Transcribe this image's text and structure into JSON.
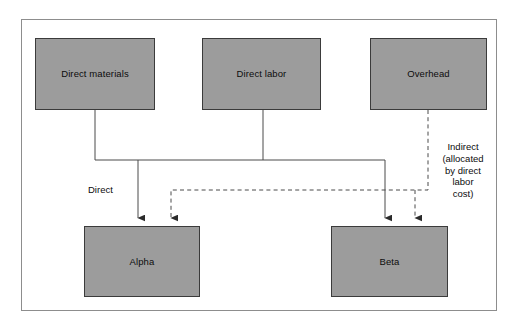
{
  "diagram": {
    "title_visible": false,
    "background": "#ffffff",
    "frame_border_color": "#8d8d8d",
    "node_fill": "#9c9c9c",
    "node_border": "#3b3b3b",
    "line_color": "#4a4a4a",
    "text_color": "#0c0c0c",
    "nodes": [
      {
        "id": "direct-materials",
        "label": "Direct materials",
        "x": 35,
        "y": 38,
        "w": 120,
        "h": 72
      },
      {
        "id": "direct-labor",
        "label": "Direct labor",
        "x": 202,
        "y": 38,
        "w": 119,
        "h": 72
      },
      {
        "id": "overhead",
        "label": "Overhead",
        "x": 370,
        "y": 38,
        "w": 117,
        "h": 72
      },
      {
        "id": "alpha",
        "label": "Alpha",
        "x": 84,
        "y": 226,
        "w": 116,
        "h": 71
      },
      {
        "id": "beta",
        "label": "Beta",
        "x": 331,
        "y": 226,
        "w": 117,
        "h": 71
      }
    ],
    "edge_labels": [
      {
        "id": "direct-label",
        "text": "Direct",
        "x": 88,
        "y": 184
      },
      {
        "id": "indirect-label",
        "text": "Indirect\n(allocated\nby direct\nlabor\ncost)",
        "x": 432,
        "y": 141
      }
    ],
    "edges": [
      {
        "id": "direct-materials-to-bus",
        "style": "solid",
        "from": "direct-materials",
        "to": "cost-bus"
      },
      {
        "id": "direct-labor-to-bus",
        "style": "solid",
        "from": "direct-labor",
        "to": "cost-bus"
      },
      {
        "id": "bus-to-alpha",
        "style": "solid",
        "from": "cost-bus",
        "to": "alpha",
        "arrow": true
      },
      {
        "id": "bus-to-beta",
        "style": "solid",
        "from": "cost-bus",
        "to": "beta",
        "arrow": true
      },
      {
        "id": "overhead-to-alpha",
        "style": "dashed",
        "from": "overhead",
        "to": "alpha",
        "arrow": true
      },
      {
        "id": "overhead-to-beta",
        "style": "dashed",
        "from": "overhead",
        "to": "beta",
        "arrow": true
      }
    ]
  }
}
